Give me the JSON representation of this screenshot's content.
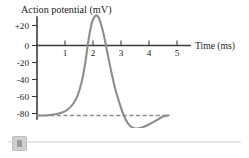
{
  "figure": {
    "title": "Action potential  (mV)",
    "x_axis_label": "Time  (ms)"
  },
  "chart_data": {
    "type": "line",
    "title": "Action potential  (mV)",
    "xlabel": "Time  (ms)",
    "ylabel": "Action potential  (mV)",
    "xlim": [
      0,
      5.4
    ],
    "ylim": [
      -92,
      36
    ],
    "grid": false,
    "legend": null,
    "x_ticks": [
      1,
      2,
      3,
      4,
      5
    ],
    "x_tick_labels": [
      "1",
      "2",
      "3",
      "4",
      "5"
    ],
    "y_ticks": [
      20,
      0,
      -20,
      -40,
      -60,
      -80
    ],
    "y_tick_labels": [
      "+20",
      "0",
      "-20",
      "-40",
      "-60",
      "-80"
    ],
    "series": [
      {
        "name": "Action potential",
        "color": "#8d8d8d",
        "x": [
          0.0,
          0.3,
          0.6,
          0.9,
          1.1,
          1.3,
          1.45,
          1.6,
          1.72,
          1.82,
          1.92,
          2.0,
          2.1,
          2.2,
          2.32,
          2.42,
          2.52,
          2.65,
          2.8,
          2.95,
          3.1,
          3.25,
          3.4,
          3.55,
          3.75,
          4.0,
          4.25,
          4.5,
          4.7
        ],
        "y": [
          -70,
          -70,
          -69,
          -67,
          -64,
          -58,
          -50,
          -36,
          -18,
          2,
          18,
          26,
          30,
          28,
          18,
          6,
          -8,
          -26,
          -44,
          -58,
          -70,
          -78,
          -82,
          -83,
          -82,
          -79,
          -75,
          -71,
          -70
        ]
      }
    ],
    "reference_lines": [
      {
        "name": "resting-potential",
        "orientation": "horizontal",
        "value": -70,
        "style": "dashed",
        "color": "#8d8d8d",
        "x_start": 0.0,
        "x_end": 4.72
      }
    ],
    "annotations": {
      "peak_value": 30,
      "peak_time": 2.1,
      "resting_potential": -70,
      "undershoot_value": -83,
      "undershoot_time": 3.55
    }
  },
  "slider": {
    "name": "horizontal-scrollbar",
    "position_percent": 2
  }
}
